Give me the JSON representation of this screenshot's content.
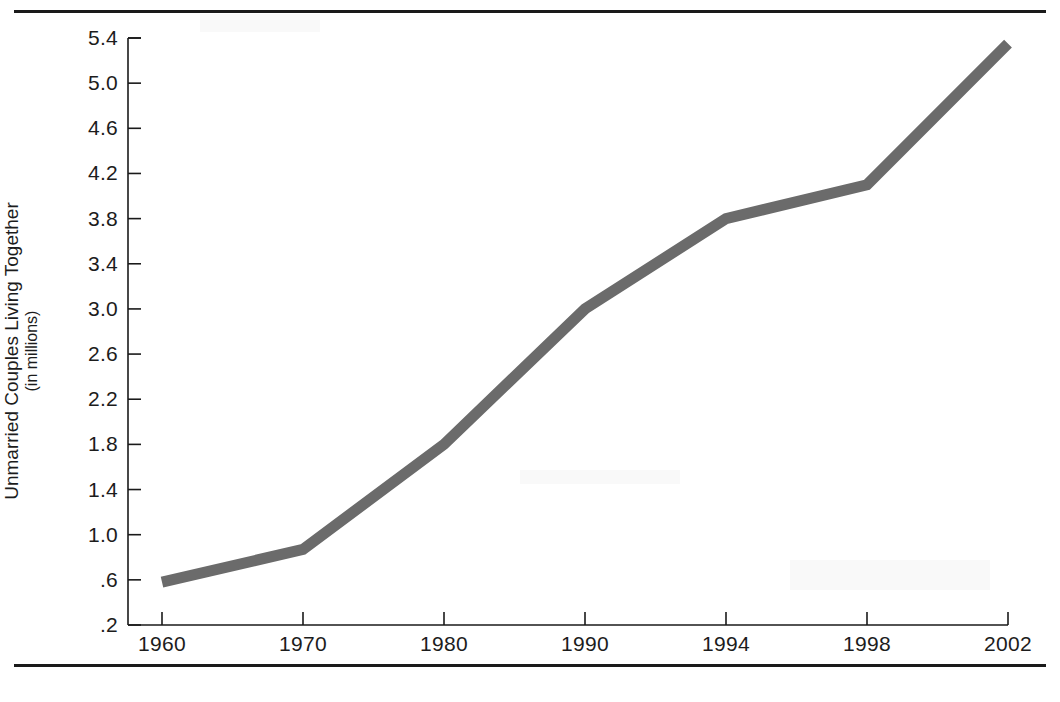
{
  "chart_data": {
    "type": "line",
    "title": "",
    "xlabel": "",
    "ylabel": "Unmarried Couples Living Together",
    "ylabel_sub": "(in millions)",
    "categories": [
      "1960",
      "1970",
      "1980",
      "1990",
      "1994",
      "1998",
      "2002"
    ],
    "values": [
      0.58,
      0.87,
      1.8,
      3.0,
      3.8,
      4.1,
      5.35
    ],
    "series": [
      {
        "name": "Unmarried Couples Living Together",
        "values": [
          0.58,
          0.87,
          1.8,
          3.0,
          3.8,
          4.1,
          5.35
        ]
      }
    ],
    "x_tick_labels": [
      "1960",
      "1970",
      "1980",
      "1990",
      "1994",
      "1998",
      "2002"
    ],
    "y_tick_labels": [
      "5.4",
      "5.0",
      "4.6",
      "4.2",
      "3.8",
      "3.4",
      "3.0",
      "2.6",
      "2.2",
      "1.8",
      "1.4",
      "1.0",
      ".6",
      ".2"
    ],
    "y_tick_values": [
      5.4,
      5.0,
      4.6,
      4.2,
      3.8,
      3.4,
      3.0,
      2.6,
      2.2,
      1.8,
      1.4,
      1.0,
      0.6,
      0.2
    ],
    "ylim": [
      0.2,
      5.4
    ],
    "y_step": 0.4,
    "grid": false,
    "legend": false,
    "legend_position": "none",
    "line_color": "#6b6b6b",
    "axis_color": "#1a1a1a",
    "background_color": "#ffffff",
    "line_width_px": 11,
    "annotations": []
  },
  "figure": {
    "rules": {
      "top": "horizontal-rule-top",
      "bottom": "horizontal-rule-bottom"
    }
  }
}
